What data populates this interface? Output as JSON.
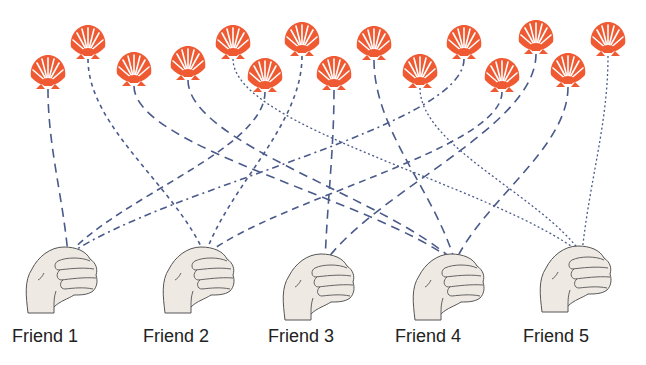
{
  "diagram": {
    "type": "bipartite-assignment",
    "colors": {
      "shell": "#ef5a33",
      "shell_ribs": "#ffffff",
      "line": "#4a5a8a",
      "fist_fill": "#efe9e4",
      "fist_stroke": "#555555",
      "label": "#222222"
    },
    "friends": [
      {
        "id": "F1",
        "label": "Friend 1",
        "x": 68,
        "y": 255,
        "label_x": 12
      },
      {
        "id": "F2",
        "label": "Friend 2",
        "x": 205,
        "y": 255,
        "label_x": 143
      },
      {
        "id": "F3",
        "label": "Friend 3",
        "x": 325,
        "y": 262,
        "label_x": 268
      },
      {
        "id": "F4",
        "label": "Friend 4",
        "x": 455,
        "y": 262,
        "label_x": 395
      },
      {
        "id": "F5",
        "label": "Friend 5",
        "x": 582,
        "y": 254,
        "label_x": 523
      }
    ],
    "shells": [
      {
        "id": "S1",
        "x": 48,
        "y": 75,
        "to": "F1",
        "style": "long-dash"
      },
      {
        "id": "S2",
        "x": 88,
        "y": 45,
        "to": "F2",
        "style": "short-dash"
      },
      {
        "id": "S3",
        "x": 134,
        "y": 72,
        "to": "F4",
        "style": "long-dash"
      },
      {
        "id": "S4",
        "x": 188,
        "y": 66,
        "to": "F4",
        "style": "long-dash"
      },
      {
        "id": "S5",
        "x": 233,
        "y": 45,
        "to": "F5",
        "style": "dotted"
      },
      {
        "id": "S6",
        "x": 265,
        "y": 78,
        "to": "F1",
        "style": "medium-dash"
      },
      {
        "id": "S7",
        "x": 302,
        "y": 42,
        "to": "F2",
        "style": "short-dash"
      },
      {
        "id": "S8",
        "x": 334,
        "y": 76,
        "to": "F3",
        "style": "long-dash"
      },
      {
        "id": "S9",
        "x": 374,
        "y": 46,
        "to": "F4",
        "style": "long-dash"
      },
      {
        "id": "S10",
        "x": 420,
        "y": 74,
        "to": "F5",
        "style": "dotted"
      },
      {
        "id": "S11",
        "x": 464,
        "y": 45,
        "to": "F1",
        "style": "dash-dot"
      },
      {
        "id": "S12",
        "x": 502,
        "y": 78,
        "to": "F2",
        "style": "medium-dash"
      },
      {
        "id": "S13",
        "x": 536,
        "y": 40,
        "to": "F3",
        "style": "long-dash"
      },
      {
        "id": "S14",
        "x": 568,
        "y": 73,
        "to": "F4",
        "style": "long-dash"
      },
      {
        "id": "S15",
        "x": 608,
        "y": 42,
        "to": "F5",
        "style": "dotted"
      }
    ]
  }
}
